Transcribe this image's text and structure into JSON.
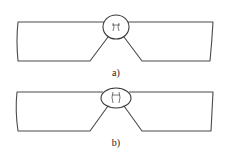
{
  "figure": {
    "panels": [
      {
        "id": "a",
        "caption": "a)",
        "weld_shape": "rounded-drop"
      },
      {
        "id": "b",
        "caption": "b)",
        "weld_shape": "ellipse"
      }
    ],
    "colors": {
      "line": "#4a4a4a",
      "background": "#ffffff"
    }
  }
}
